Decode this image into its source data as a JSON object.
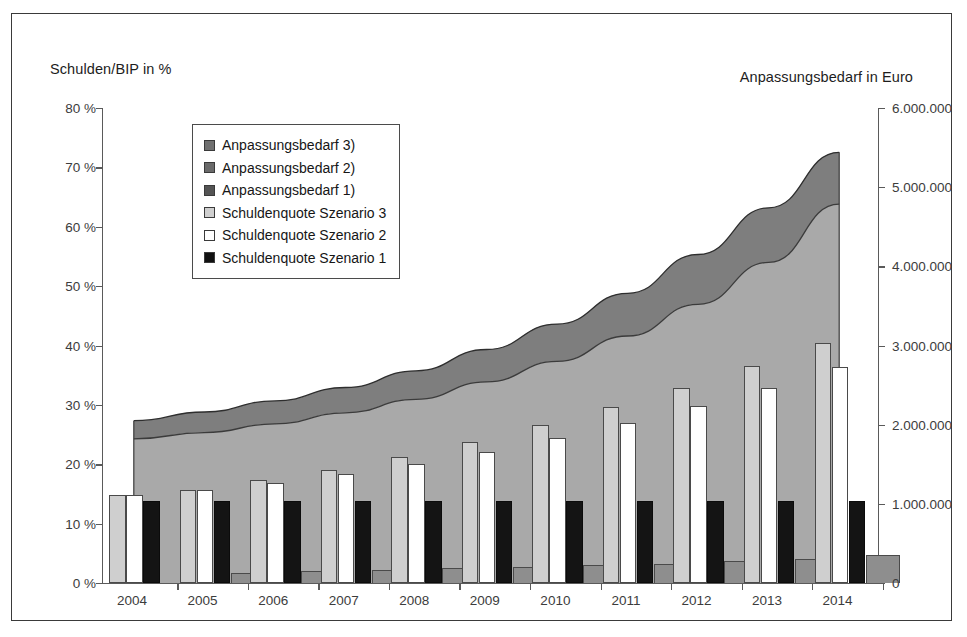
{
  "axis_titles": {
    "left": "Schulden/BIP in %",
    "right": "Anpassungsbedarf in Euro"
  },
  "legend": {
    "items": [
      {
        "label": "Anpassungsbedarf 3)",
        "swatch": "sw-a3",
        "color": "#707070"
      },
      {
        "label": "Anpassungsbedarf 2)",
        "swatch": "sw-a2",
        "color": "#6a6a6a"
      },
      {
        "label": "Anpassungsbedarf 1)",
        "swatch": "sw-a1",
        "color": "#545454"
      },
      {
        "label": "Schuldenquote Szenario 3",
        "swatch": "sw-q3",
        "color": "#cfcfcf"
      },
      {
        "label": "Schuldenquote Szenario 2",
        "swatch": "sw-q2",
        "color": "#ffffff"
      },
      {
        "label": "Schuldenquote Szenario 1",
        "swatch": "sw-q1",
        "color": "#111111"
      }
    ]
  },
  "chart_data": {
    "type": "bar",
    "title": "",
    "xlabel": "",
    "ylabel": "Schulden/BIP in %",
    "y2label": "Anpassungsbedarf in Euro",
    "ylim": [
      0,
      80
    ],
    "y2lim": [
      0,
      6000000
    ],
    "grid": false,
    "legend_position": "upper-left-inside",
    "categories": [
      "2004",
      "2005",
      "2006",
      "2007",
      "2008",
      "2009",
      "2010",
      "2011",
      "2012",
      "2013",
      "2014"
    ],
    "yticks": [
      0,
      10,
      20,
      30,
      40,
      50,
      60,
      70,
      80
    ],
    "ytick_labels": [
      "0 %",
      "10 %",
      "20 %",
      "30 %",
      "40 %",
      "50 %",
      "60 %",
      "70 %",
      "80 %"
    ],
    "y2ticks": [
      0,
      1000000,
      2000000,
      3000000,
      4000000,
      5000000,
      6000000
    ],
    "y2tick_labels": [
      "0",
      "1.000.000",
      "2.000.000",
      "3.000.000",
      "4.000.000",
      "5.000.000",
      "6.000.000"
    ],
    "series": [
      {
        "name": "Schuldenquote Szenario 3",
        "axis": "left",
        "kind": "bar",
        "color": "#cfcfcf",
        "values": [
          14.8,
          15.7,
          17.3,
          19.0,
          21.2,
          23.7,
          26.6,
          29.7,
          32.9,
          36.6,
          40.5
        ]
      },
      {
        "name": "Schuldenquote Szenario 2",
        "axis": "left",
        "kind": "bar",
        "color": "#ffffff",
        "values": [
          14.8,
          15.7,
          16.9,
          18.3,
          20.1,
          22.1,
          24.4,
          26.9,
          29.9,
          32.9,
          36.4
        ]
      },
      {
        "name": "Schuldenquote Szenario 1",
        "axis": "left",
        "kind": "bar",
        "color": "#111111",
        "values": [
          13.9,
          13.9,
          13.9,
          13.9,
          13.9,
          13.9,
          13.9,
          13.9,
          13.9,
          13.9,
          13.9
        ]
      },
      {
        "name": "Anpassungsbedarf 1)",
        "axis": "right",
        "kind": "bar",
        "color": "#8e8e8e",
        "values": [
          0,
          130000,
          150000,
          165000,
          185000,
          205000,
          225000,
          245000,
          275000,
          310000,
          355000
        ]
      },
      {
        "name": "Anpassungsbedarf 2)",
        "axis": "right",
        "kind": "area",
        "color": "#a8a8a8",
        "values": [
          1820000,
          1900000,
          2010000,
          2150000,
          2320000,
          2540000,
          2800000,
          3120000,
          3520000,
          4050000,
          4785000
        ]
      },
      {
        "name": "Anpassungsbedarf 3)",
        "axis": "right",
        "kind": "area",
        "color": "#7d7d7d",
        "values": [
          2050000,
          2160000,
          2300000,
          2470000,
          2680000,
          2950000,
          3270000,
          3660000,
          4150000,
          4740000,
          5440000
        ]
      }
    ]
  }
}
